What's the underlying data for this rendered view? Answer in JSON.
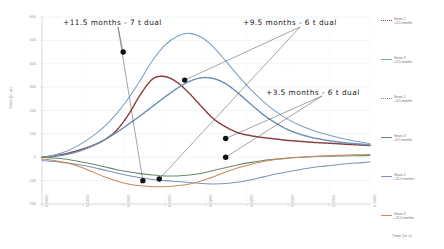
{
  "chart_data": {
    "type": "line",
    "title": "",
    "xlabel": "Time (in s)",
    "ylabel": "Strain (in µε)",
    "xlim": [
      0.0,
      0.04
    ],
    "ylim": [
      -200,
      600
    ],
    "grid": true,
    "legend_position": "right",
    "xticks": [
      "0,0000",
      "0,0050",
      "0,0100",
      "0,0150",
      "0,0200",
      "0,0250",
      "0,0300",
      "0,0350",
      "0,0400"
    ],
    "xtick_values": [
      0.0,
      0.005,
      0.01,
      0.015,
      0.02,
      0.025,
      0.03,
      0.035,
      0.04
    ],
    "yticks": [
      "600",
      "500",
      "400",
      "300",
      "200",
      "100",
      "0",
      "-100",
      "-200"
    ],
    "ytick_values": [
      600,
      500,
      400,
      300,
      200,
      100,
      0,
      -100,
      -200
    ],
    "x": [
      0.0,
      0.0015,
      0.003,
      0.0045,
      0.006,
      0.0075,
      0.009,
      0.0105,
      0.012,
      0.0135,
      0.015,
      0.0165,
      0.018,
      0.0195,
      0.021,
      0.0225,
      0.024,
      0.0255,
      0.027,
      0.0285,
      0.03,
      0.0315,
      0.033,
      0.0345,
      0.036,
      0.0375,
      0.039,
      0.04
    ],
    "series": [
      {
        "name": "Strain-2 +3.5 months",
        "color": "#8c3b3b",
        "style": "dotted",
        "values": [
          0,
          6,
          16,
          30,
          48,
          72,
          112,
          180,
          268,
          335,
          345,
          320,
          272,
          215,
          162,
          128,
          104,
          92,
          84,
          78,
          72,
          68,
          64,
          61,
          58,
          55,
          52,
          50
        ]
      },
      {
        "name": "Strain-3 +3.5 months",
        "color": "#7a9fc4",
        "style": "solid",
        "values": [
          0,
          10,
          26,
          52,
          86,
          128,
          182,
          250,
          330,
          415,
          480,
          518,
          530,
          512,
          468,
          408,
          346,
          288,
          238,
          196,
          162,
          136,
          116,
          100,
          86,
          74,
          64,
          58
        ]
      },
      {
        "name": "Strain-1 +3.5 months",
        "color": "#6f8fb5",
        "style": "dotted",
        "values": [
          0,
          4,
          12,
          26,
          46,
          72,
          104,
          140,
          178,
          218,
          258,
          295,
          325,
          340,
          336,
          312,
          272,
          226,
          182,
          146,
          118,
          98,
          84,
          74,
          66,
          60,
          56,
          52
        ]
      },
      {
        "name": "Strain-3 +9.5 months",
        "color": "#6b8a6b",
        "style": "solid",
        "values": [
          0,
          -3,
          -9,
          -18,
          -28,
          -40,
          -52,
          -62,
          -70,
          -76,
          -80,
          -80,
          -76,
          -68,
          -56,
          -44,
          -32,
          -22,
          -14,
          -8,
          -3,
          0,
          2,
          4,
          5,
          6,
          7,
          8
        ]
      },
      {
        "name": "Strain-2 +11.5 months",
        "color": "#7d95b5",
        "style": "solid",
        "values": [
          -14,
          -18,
          -24,
          -32,
          -42,
          -54,
          -66,
          -78,
          -88,
          -95,
          -100,
          -104,
          -108,
          -112,
          -114,
          -112,
          -106,
          -96,
          -84,
          -72,
          -62,
          -52,
          -44,
          -38,
          -32,
          -27,
          -23,
          -20
        ]
      },
      {
        "name": "Strain-3 +11.5 months",
        "color": "#c98a5c",
        "style": "solid",
        "values": [
          -8,
          -14,
          -24,
          -40,
          -60,
          -82,
          -100,
          -114,
          -122,
          -126,
          -126,
          -122,
          -114,
          -100,
          -82,
          -62,
          -44,
          -30,
          -18,
          -10,
          -4,
          0,
          3,
          6,
          8,
          10,
          11,
          12
        ]
      }
    ],
    "annotations": [
      {
        "text": "+11.5 months - 7 t dual",
        "points": [
          [
            0.0123,
            -100
          ],
          [
            0.0099,
            450
          ]
        ]
      },
      {
        "text": "+9.5 months - 6 t dual",
        "points": [
          [
            0.0143,
            -93
          ],
          [
            0.0174,
            330
          ]
        ]
      },
      {
        "text": "+3.5 months - 6 t dual",
        "points": [
          [
            0.0224,
            80
          ],
          [
            0.0224,
            0
          ]
        ]
      }
    ],
    "markers": [
      {
        "x": 0.0123,
        "y": -100
      },
      {
        "x": 0.0099,
        "y": 450
      },
      {
        "x": 0.0143,
        "y": -93
      },
      {
        "x": 0.0174,
        "y": 330
      },
      {
        "x": 0.0224,
        "y": 80
      },
      {
        "x": 0.0224,
        "y": 0
      }
    ]
  },
  "legend": {
    "items": [
      {
        "label_line1": "Strain-2",
        "label_line2": "+3.5 months",
        "color": "#8c3b3b",
        "style": "dotted"
      },
      {
        "label_line1": "Strain-3",
        "label_line2": "+3.5 months",
        "color": "#7a9fc4",
        "style": "solid"
      },
      {
        "label_line1": "Strain-1",
        "label_line2": "+3.5 months",
        "color": "#6f8fb5",
        "style": "dotted"
      },
      {
        "label_line1": "Strain-3",
        "label_line2": "+9.5 months",
        "color": "#6b8a6b",
        "style": "solid"
      },
      {
        "label_line1": "Strain-2",
        "label_line2": "+11.5 months",
        "color": "#7d95b5",
        "style": "solid"
      },
      {
        "label_line1": "Strain-3",
        "label_line2": "+11.5 months",
        "color": "#c98a5c",
        "style": "solid"
      }
    ]
  }
}
